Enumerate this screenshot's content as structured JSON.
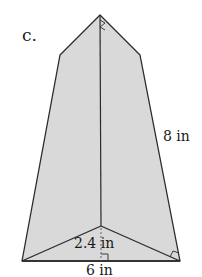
{
  "figure": {
    "part_label": "c.",
    "shape": "square pyramid (net-like front view showing triangular faces)",
    "fill_color": "#d9d9d9",
    "stroke_color": "#2a2a2a",
    "labels": {
      "slant_height": "8 in",
      "triangle_height": "2.4 in",
      "base_side": "6 in"
    },
    "markers": {
      "right_angle_base": "right-angle-marker",
      "right_angle_corner": "right-angle-marker",
      "apex_tick": "right-angle-marker"
    }
  }
}
